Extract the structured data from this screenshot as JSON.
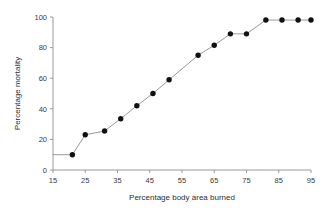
{
  "chart_data": {
    "type": "line",
    "title": "",
    "xlabel": "Percentage body area burned",
    "ylabel": "Percentage mortality",
    "xlim": [
      15,
      95
    ],
    "ylim": [
      0,
      100
    ],
    "xticks": [
      15,
      25,
      35,
      45,
      55,
      65,
      75,
      85,
      95
    ],
    "xtick_labels": [
      "15",
      "25",
      "35",
      "45",
      "55",
      "65",
      "75",
      "85",
      "95"
    ],
    "yticks": [
      0,
      20,
      40,
      60,
      80,
      100
    ],
    "ytick_labels": [
      "0",
      "20",
      "40",
      "60",
      "80",
      "100"
    ],
    "grid": false,
    "legend": false,
    "marker": "filled-circle",
    "marker_color": "#111111",
    "line_color": "#8d8d8d",
    "leader_segment": {
      "description": "horizontal line from y-axis at x=15 to first marker",
      "x": [
        15,
        21
      ],
      "y": [
        10,
        10
      ]
    },
    "x": [
      21,
      25,
      31,
      36,
      41,
      46,
      51,
      60,
      65,
      70,
      75,
      81,
      86,
      91,
      95
    ],
    "y": [
      10,
      23,
      25.5,
      33.5,
      42,
      50,
      59,
      75,
      81.5,
      89,
      89,
      98,
      98,
      98,
      98
    ],
    "series": [
      {
        "name": "Mortality",
        "points": [
          {
            "x": 21,
            "y": 10
          },
          {
            "x": 25,
            "y": 23
          },
          {
            "x": 31,
            "y": 25.5
          },
          {
            "x": 36,
            "y": 33.5
          },
          {
            "x": 41,
            "y": 42
          },
          {
            "x": 46,
            "y": 50
          },
          {
            "x": 51,
            "y": 59
          },
          {
            "x": 60,
            "y": 75
          },
          {
            "x": 65,
            "y": 81.5
          },
          {
            "x": 70,
            "y": 89
          },
          {
            "x": 75,
            "y": 89
          },
          {
            "x": 81,
            "y": 98
          },
          {
            "x": 86,
            "y": 98
          },
          {
            "x": 91,
            "y": 98
          },
          {
            "x": 95,
            "y": 98
          }
        ]
      }
    ]
  }
}
